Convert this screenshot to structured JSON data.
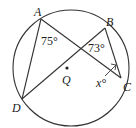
{
  "diagram": {
    "type": "circle-geometry",
    "circle_center_label": "Q",
    "points": {
      "A": "A",
      "B": "B",
      "C": "C",
      "D": "D"
    },
    "angles": {
      "angle_A": "75°",
      "angle_intersection": "73°",
      "angle_C": "x°"
    },
    "segments": [
      "AD",
      "AC",
      "DB",
      "BC"
    ]
  }
}
